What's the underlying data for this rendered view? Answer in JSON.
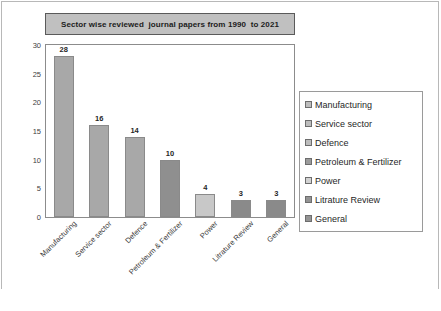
{
  "chart_data": {
    "type": "bar",
    "title": "Sector wise reviewed  journal papers from 1990  to 2021",
    "xlabel": "",
    "ylabel": "",
    "ylim": [
      0,
      30
    ],
    "yticks": [
      0,
      5,
      10,
      15,
      20,
      25,
      30
    ],
    "ytick_labels": [
      "0",
      "5",
      "10",
      "15",
      "20",
      "25",
      "30"
    ],
    "grid": false,
    "legend_position": "right",
    "categories": [
      "Manufacturing",
      "Service sector",
      "Defence",
      "Petroleum & Fertilizer",
      "Power",
      "Litrature Review",
      "General"
    ],
    "values": [
      28,
      16,
      14,
      10,
      4,
      3,
      3
    ],
    "value_labels": [
      "28",
      "16",
      "14",
      "10",
      "4",
      "3",
      "3"
    ],
    "bar_colors": [
      "#a8a8a8",
      "#a8a8a8",
      "#a8a8a8",
      "#8f8f8f",
      "#c8c8c8",
      "#8a8a8a",
      "#8a8a8a"
    ],
    "legend": [
      {
        "label": "Manufacturing",
        "color": "#bdbdbd"
      },
      {
        "label": "Service sector",
        "color": "#bdbdbd"
      },
      {
        "label": "Defence",
        "color": "#bdbdbd"
      },
      {
        "label": " Petroleum & Fertilizer",
        "color": "#9b9b9b"
      },
      {
        "label": "Power",
        "color": "#d2d2d2"
      },
      {
        "label": "Litrature Review",
        "color": "#949494"
      },
      {
        "label": "General",
        "color": "#949494"
      }
    ]
  },
  "style": {
    "title_fill": "#c0c0c0",
    "title_border": "#5a5a5a",
    "plot_border": "#8c8c8c",
    "figure_border": "#b8b8b8",
    "axis_text": "#404040"
  }
}
